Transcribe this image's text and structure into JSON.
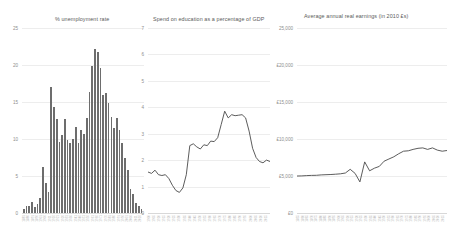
{
  "figure": {
    "background": "#ffffff",
    "line_color": "#4a4a4a",
    "bar_color": "#6d6d6d",
    "grid_color": "#ededed"
  },
  "chart_data": [
    {
      "type": "bar",
      "title": "% unemployment rate",
      "xlabel": "",
      "ylabel": "",
      "ylim": [
        0,
        25
      ],
      "yticks": [
        "0",
        "5",
        "10",
        "15",
        "20",
        "25"
      ],
      "grid": true,
      "legend": "none",
      "categories": [
        "1881",
        "1886",
        "1891",
        "1896",
        "1901",
        "1906",
        "1911",
        "1916",
        "1921",
        "1926",
        "1931",
        "1936",
        "1941",
        "1946",
        "1951",
        "1956",
        "1961",
        "1966",
        "1971",
        "1976",
        "1981",
        "1986",
        "1991",
        "1996",
        "2001",
        "2006",
        "2011",
        "2016"
      ],
      "values": [
        0.6,
        0.9,
        1.0,
        1.5,
        0.8,
        1.2,
        2.0,
        6.2,
        4.0,
        2.8,
        17.0,
        14.3,
        12.7,
        9.6,
        10.6,
        12.7,
        9.9,
        9.4,
        10.0,
        11.6,
        9.4,
        11.2,
        10.7,
        12.9,
        16.4,
        19.9,
        22.1,
        21.8,
        19.6,
        15.9,
        16.2,
        14.9,
        13.0,
        11.5,
        12.9,
        11.2,
        9.4,
        7.5,
        5.8,
        3.2,
        2.6,
        1.4,
        0.9,
        0.5
      ]
    },
    {
      "type": "line",
      "title": "Spend on education as a percentage of GDP",
      "xlabel": "",
      "ylabel": "",
      "ylim": [
        0,
        7
      ],
      "yticks": [
        "0",
        "1",
        "2",
        "3",
        "4",
        "5",
        "6",
        "7"
      ],
      "grid": true,
      "legend": "none",
      "x": [
        "1900",
        "1905",
        "1910",
        "1915",
        "1920",
        "1925",
        "1930",
        "1935",
        "1940",
        "1945",
        "1950",
        "1955",
        "1960",
        "1965",
        "1970",
        "1975",
        "1980",
        "1985",
        "1990",
        "1995",
        "2000",
        "2005",
        "2010",
        "2015"
      ],
      "values": [
        1.55,
        1.5,
        1.62,
        1.45,
        1.42,
        1.45,
        1.3,
        1.05,
        0.85,
        0.78,
        0.95,
        1.45,
        2.55,
        2.62,
        2.5,
        2.42,
        2.58,
        2.55,
        2.72,
        2.7,
        2.85,
        3.35,
        3.85,
        3.6,
        3.72,
        3.68,
        3.7,
        3.72,
        3.6,
        3.1,
        2.45,
        2.1,
        1.95,
        1.9,
        2.0,
        1.95
      ]
    },
    {
      "type": "line",
      "title": "Average annual real earnings (in 2010 £s)",
      "xlabel": "",
      "ylabel": "",
      "ylim": [
        0,
        25000
      ],
      "yticks": [
        "£0",
        "£5,000",
        "£10,000",
        "£15,000",
        "£20,000",
        "25,000"
      ],
      "grid": true,
      "legend": "none",
      "x": [
        "1855",
        "1860",
        "1865",
        "1870",
        "1875",
        "1880",
        "1885",
        "1890",
        "1895",
        "1900",
        "1905",
        "1910",
        "1915",
        "1920",
        "1925",
        "1930",
        "1935",
        "1940",
        "1945",
        "1950",
        "1955",
        "1960",
        "1965",
        "1970",
        "1975",
        "1980",
        "1985",
        "1990",
        "1995",
        "2000",
        "2005",
        "2010",
        "2015"
      ],
      "values": [
        5000,
        5020,
        5050,
        5080,
        5100,
        5150,
        5180,
        5200,
        5250,
        5300,
        5400,
        5900,
        5350,
        4200,
        6900,
        5700,
        6050,
        6300,
        7000,
        7300,
        7600,
        8000,
        8350,
        8400,
        8600,
        8750,
        8800,
        8600,
        8800,
        8500,
        8350,
        8450
      ]
    }
  ],
  "panels": {
    "unemployment": {
      "title": "% unemployment rate",
      "yticks": [
        "25",
        "20",
        "15",
        "10",
        "5",
        "0"
      ]
    },
    "education": {
      "title": "Spend on education as a percentage of GDP",
      "yticks": [
        "7",
        "6",
        "5",
        "4",
        "3",
        "2",
        "1",
        "0"
      ]
    },
    "earnings": {
      "title": "Average annual real earnings (in 2010 £s)",
      "yticks": [
        "25,000",
        "£20,000",
        "£15,000",
        "£10,000",
        "£5,000",
        "£0"
      ]
    }
  }
}
